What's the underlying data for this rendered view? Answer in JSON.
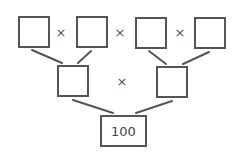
{
  "diagram": {
    "type": "multiplication-factor-tree",
    "stroke_color": "#555555",
    "background": "#ffffff",
    "top_row": {
      "boxes": [
        "",
        "",
        "",
        ""
      ],
      "operators": [
        "×",
        "×",
        "×"
      ]
    },
    "middle_row": {
      "boxes": [
        "",
        ""
      ],
      "operators": [
        "×"
      ]
    },
    "bottom_row": {
      "boxes": [
        "100"
      ]
    }
  }
}
